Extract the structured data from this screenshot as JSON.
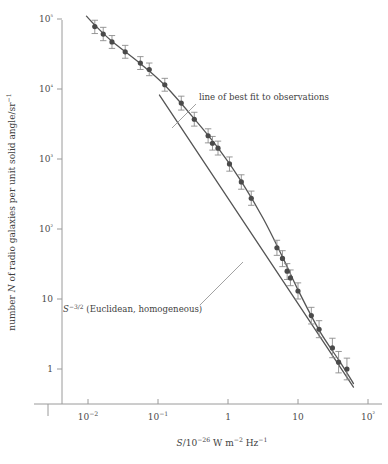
{
  "chart_data": {
    "type": "scatter",
    "title": "",
    "xlabel": "S/10^-26 W m^-2 Hz^-1",
    "ylabel": "number N of radio galaxies per unit solid angle/sr^-1",
    "xscale": "log",
    "yscale": "log",
    "xlim": [
      0.003,
      100
    ],
    "ylim": [
      0.55,
      130000
    ],
    "grid": false,
    "legend": null,
    "x_tick_values": [
      0.01,
      0.1,
      1,
      10,
      100
    ],
    "x_tick_labels": [
      "10−2",
      "10−1",
      "1",
      "10",
      "10²"
    ],
    "y_tick_values": [
      1,
      10,
      100,
      1000,
      10000,
      100000
    ],
    "y_tick_labels": [
      "1",
      "10",
      "10²",
      "10³",
      "10⁴",
      "10⁵"
    ],
    "points": [
      {
        "x": 0.0125,
        "y": 78000,
        "yerr_lo": 62000,
        "yerr_hi": 96000
      },
      {
        "x": 0.0165,
        "y": 61000,
        "yerr_lo": 49000,
        "yerr_hi": 76000
      },
      {
        "x": 0.022,
        "y": 47000,
        "yerr_lo": 38000,
        "yerr_hi": 58000
      },
      {
        "x": 0.034,
        "y": 34000,
        "yerr_lo": 27500,
        "yerr_hi": 42000
      },
      {
        "x": 0.056,
        "y": 23500,
        "yerr_lo": 19000,
        "yerr_hi": 29000
      },
      {
        "x": 0.075,
        "y": 19000,
        "yerr_lo": 15500,
        "yerr_hi": 23500
      },
      {
        "x": 0.125,
        "y": 11500,
        "yerr_lo": 9300,
        "yerr_hi": 14200
      },
      {
        "x": 0.215,
        "y": 6300,
        "yerr_lo": 5000,
        "yerr_hi": 7900
      },
      {
        "x": 0.33,
        "y": 3700,
        "yerr_lo": 2950,
        "yerr_hi": 4650
      },
      {
        "x": 0.52,
        "y": 2150,
        "yerr_lo": 1700,
        "yerr_hi": 2700
      },
      {
        "x": 0.6,
        "y": 1680,
        "yerr_lo": 1340,
        "yerr_hi": 2100
      },
      {
        "x": 0.72,
        "y": 1430,
        "yerr_lo": 1140,
        "yerr_hi": 1800
      },
      {
        "x": 1.05,
        "y": 850,
        "yerr_lo": 670,
        "yerr_hi": 1070
      },
      {
        "x": 1.55,
        "y": 470,
        "yerr_lo": 370,
        "yerr_hi": 595
      },
      {
        "x": 2.15,
        "y": 275,
        "yerr_lo": 218,
        "yerr_hi": 348
      },
      {
        "x": 5.0,
        "y": 54,
        "yerr_lo": 42,
        "yerr_hi": 69
      },
      {
        "x": 6.0,
        "y": 38,
        "yerr_lo": 29,
        "yerr_hi": 49
      },
      {
        "x": 7.0,
        "y": 25,
        "yerr_lo": 19,
        "yerr_hi": 32
      },
      {
        "x": 7.8,
        "y": 20,
        "yerr_lo": 15.5,
        "yerr_hi": 26
      },
      {
        "x": 10.0,
        "y": 13,
        "yerr_lo": 10,
        "yerr_hi": 17
      },
      {
        "x": 15.5,
        "y": 5.8,
        "yerr_lo": 4.4,
        "yerr_hi": 7.6
      },
      {
        "x": 20.0,
        "y": 3.7,
        "yerr_lo": 2.8,
        "yerr_hi": 4.9
      },
      {
        "x": 31.0,
        "y": 2.0,
        "yerr_lo": 1.45,
        "yerr_hi": 2.75
      },
      {
        "x": 38.0,
        "y": 1.25,
        "yerr_lo": 0.88,
        "yerr_hi": 1.78
      },
      {
        "x": 50.0,
        "y": 1.0,
        "yerr_lo": 0.7,
        "yerr_hi": 1.43
      }
    ],
    "curves": [
      {
        "name": "line of best fit to observations",
        "style": "solid",
        "points": [
          {
            "x": 0.0095,
            "y": 110000
          },
          {
            "x": 0.0125,
            "y": 82000
          },
          {
            "x": 0.022,
            "y": 48000
          },
          {
            "x": 0.056,
            "y": 23000
          },
          {
            "x": 0.125,
            "y": 11300
          },
          {
            "x": 0.33,
            "y": 3750
          },
          {
            "x": 0.72,
            "y": 1440
          },
          {
            "x": 1.55,
            "y": 480
          },
          {
            "x": 3.2,
            "y": 140
          },
          {
            "x": 6.0,
            "y": 40
          },
          {
            "x": 10.0,
            "y": 13.5
          },
          {
            "x": 20.0,
            "y": 3.6
          },
          {
            "x": 40.0,
            "y": 1.25
          },
          {
            "x": 62.0,
            "y": 0.62
          }
        ]
      },
      {
        "name": "S^-3/2 (Euclidean, homogeneous)",
        "style": "solid",
        "points": [
          {
            "x": 0.105,
            "y": 8200
          },
          {
            "x": 62.0,
            "y": 0.55
          }
        ]
      }
    ],
    "annotations": [
      {
        "id": "best-fit-label",
        "text": "line of best fit to observations",
        "text_x_px": 199,
        "text_y_px": 100,
        "leader_from_px": [
          196,
          104
        ],
        "leader_to_px": [
          172,
          128
        ]
      },
      {
        "id": "euclidean-label",
        "text": "S^-3/2 (Euclidean, homogeneous)",
        "text_x_px": 63,
        "text_y_px": 312,
        "leader_from_px": [
          200,
          305
        ],
        "leader_to_px": [
          243,
          262
        ]
      }
    ]
  },
  "labels": {
    "y_axis_title_parts": {
      "pre": "number ",
      "italic_n": "N",
      "mid": " of radio galaxies per unit solid angle/sr",
      "sup": "−1"
    },
    "x_axis_title_parts": {
      "italic_s": "S",
      "slash": "/10",
      "sup1": "−26",
      "w": " W m",
      "sup2": "−2",
      "hz": " Hz",
      "sup3": "−1"
    },
    "annotation_best_fit": "line of best fit to observations",
    "annotation_euclid_parts": {
      "italic_s": "S",
      "sup": "−3/2",
      "rest": " (Euclidean, homogeneous)"
    }
  },
  "colors": {
    "background": "#ffffff",
    "axis": "#9a9a9a",
    "line": "#555555",
    "point": "#4a4a4a",
    "errorbar": "#8c8c8c",
    "text": "#3f3f3f"
  }
}
